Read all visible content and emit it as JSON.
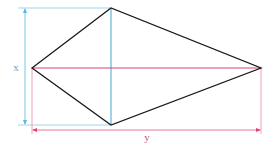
{
  "diagram": {
    "type": "kite",
    "labels": {
      "x": "x",
      "y": "y"
    },
    "vertices": {
      "left": [
        32,
        68
      ],
      "top": [
        111,
        8
      ],
      "right": [
        261,
        68
      ],
      "bottom": [
        111,
        125
      ]
    },
    "colors": {
      "outline": "#1a1a1a",
      "diagonal_x": "#5bb8e0",
      "diagonal_y": "#e0456a",
      "dimension_x": "#7cc4e6",
      "dimension_y": "#e8789a",
      "label_x": "#6aa6c8",
      "label_y": "#c65a7a"
    }
  }
}
